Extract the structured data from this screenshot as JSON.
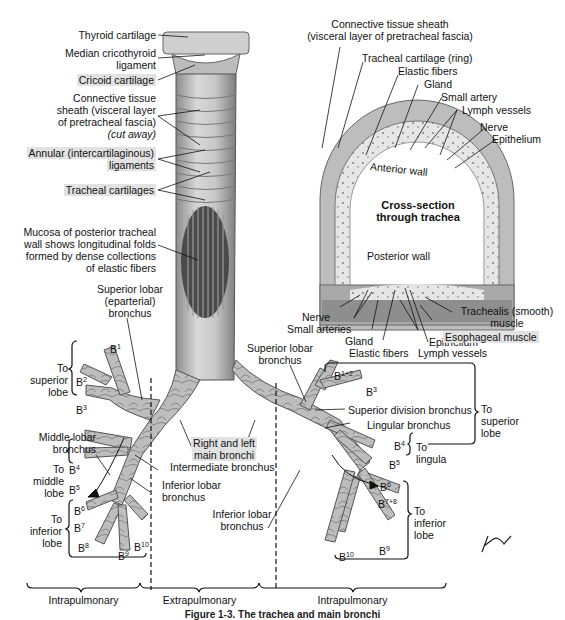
{
  "figure": {
    "caption": "Figure 1-3. The trachea and main bronchi"
  },
  "trachea_labels": {
    "thyroid_cartilage": "Thyroid cartilage",
    "median_cricothyroid_1": "Median cricothyroid",
    "median_cricothyroid_2": "ligament",
    "cricoid_cartilage": "Cricoid cartilage",
    "sheath_1": "Connective tissue",
    "sheath_2": "sheath (visceral layer",
    "sheath_3": "of pretracheal fascia)",
    "sheath_4": "(cut away)",
    "annular_1": "Annular (intercartilaginous)",
    "annular_2": "ligaments",
    "tracheal_cartilages": "Tracheal cartilages",
    "mucosa_1": "Mucosa of posterior tracheal",
    "mucosa_2": "wall shows longitudinal folds",
    "mucosa_3": "formed by dense collections",
    "mucosa_4": "of elastic fibers"
  },
  "cross_section": {
    "title_1": "Cross-section",
    "title_2": "through trachea",
    "anterior_wall": "Anterior wall",
    "posterior_wall": "Posterior wall",
    "top_labels": {
      "sheath_1": "Connective tissue sheath",
      "sheath_2": "(visceral layer of pretracheal fascia)",
      "cartilage_ring": "Tracheal cartilage (ring)",
      "elastic_fibers": "Elastic fibers",
      "gland": "Gland",
      "small_artery": "Small artery",
      "lymph_vessels": "Lymph vessels",
      "nerve": "Nerve",
      "epithelium": "Epithelium"
    },
    "bottom_labels": {
      "nerve": "Nerve",
      "small_arteries": "Small arteries",
      "gland": "Gland",
      "elastic_fibers": "Elastic fibers",
      "epithelium": "Epithelium",
      "lymph_vessels": "Lymph vessels",
      "trachealis_1": "Trachealis (smooth)",
      "trachealis_2": "muscle",
      "esophageal_muscle": "Esophageal muscle"
    }
  },
  "right_lung": {
    "superior_lobar_1": "Superior lobar",
    "superior_lobar_2": "(eparterial)",
    "superior_lobar_3": "bronchus",
    "to_superior_1": "To",
    "to_superior_2": "superior",
    "to_superior_3": "lobe",
    "b1": "B",
    "b1_sup": "1",
    "b2": "B",
    "b2_sup": "2",
    "b3": "B",
    "b3_sup": "3",
    "middle_lobar_1": "Middle lobar",
    "middle_lobar_2": "bronchus",
    "to_middle_1": "To",
    "to_middle_2": "middle",
    "to_middle_3": "lobe",
    "b4": "B",
    "b4_sup": "4",
    "b5": "B",
    "b5_sup": "5",
    "to_inferior_1": "To",
    "to_inferior_2": "inferior",
    "to_inferior_3": "lobe",
    "b6": "B",
    "b6_sup": "6",
    "b7": "B",
    "b7_sup": "7",
    "b8": "B",
    "b8_sup": "8",
    "b9": "B",
    "b9_sup": "9",
    "b10": "B",
    "b10_sup": "10",
    "intermediate_bronchus": "Intermediate bronchus",
    "inferior_lobar_1": "Inferior lobar",
    "inferior_lobar_2": "bronchus"
  },
  "main_bronchi": {
    "line_1": "Right and left",
    "line_2": "main bronchi"
  },
  "left_lung": {
    "superior_lobar_1": "Superior lobar",
    "superior_lobar_2": "bronchus",
    "b12": "B",
    "b12_sup": "1+2",
    "b3": "B",
    "b3_sup": "3",
    "superior_division": "Superior division bronchus",
    "lingular": "Lingular bronchus",
    "b4": "B",
    "b4_sup": "4",
    "b5": "B",
    "b5_sup": "5",
    "to_lingula_1": "To",
    "to_lingula_2": "lingula",
    "to_superior_1": "To",
    "to_superior_2": "superior",
    "to_superior_3": "lobe",
    "b6": "B",
    "b6_sup": "6",
    "b78": "B",
    "b78_sup": "7+8",
    "b9": "B",
    "b9_sup": "9",
    "b10": "B",
    "b10_sup": "10",
    "to_inferior_1": "To",
    "to_inferior_2": "inferior",
    "to_inferior_3": "lobe",
    "inferior_lobar_1": "Inferior lobar",
    "inferior_lobar_2": "bronchus"
  },
  "regions": {
    "left": "Intrapulmonary",
    "middle": "Extrapulmonary",
    "right": "Intrapulmonary"
  },
  "signature": "F. Netter",
  "colors": {
    "highlight": "#e2e2e2",
    "tissue_light": "#d9d9d9",
    "tissue_mid": "#a8a8a8",
    "tissue_dark": "#6a6a6a"
  }
}
